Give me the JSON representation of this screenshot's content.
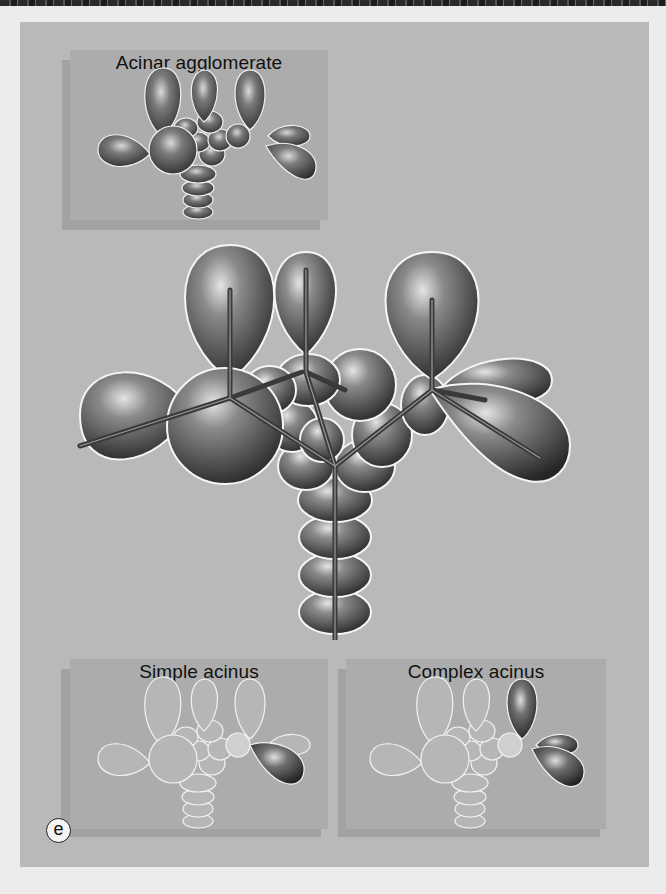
{
  "figure": {
    "panel_label": "e",
    "colors": {
      "page_background": "#ececec",
      "panel_background": "#b9b9b9",
      "inset_background": "#acacac",
      "inset_shadow": "#a2a2a2",
      "lobe_dark": "#3c3c3c",
      "lobe_highlight": "#d8d8d8",
      "lobe_faded": "#bdbdbd",
      "outline": "#f5f5f5"
    }
  },
  "insets": {
    "top": {
      "title": "Acinar agglomerate"
    },
    "bottom_left": {
      "title": "Simple acinus"
    },
    "bottom_right": {
      "title": "Complex acinus"
    }
  },
  "main_illustration": {
    "description": "Enlarged branching duct system with acini (secretory lobes) and central excretory duct"
  }
}
